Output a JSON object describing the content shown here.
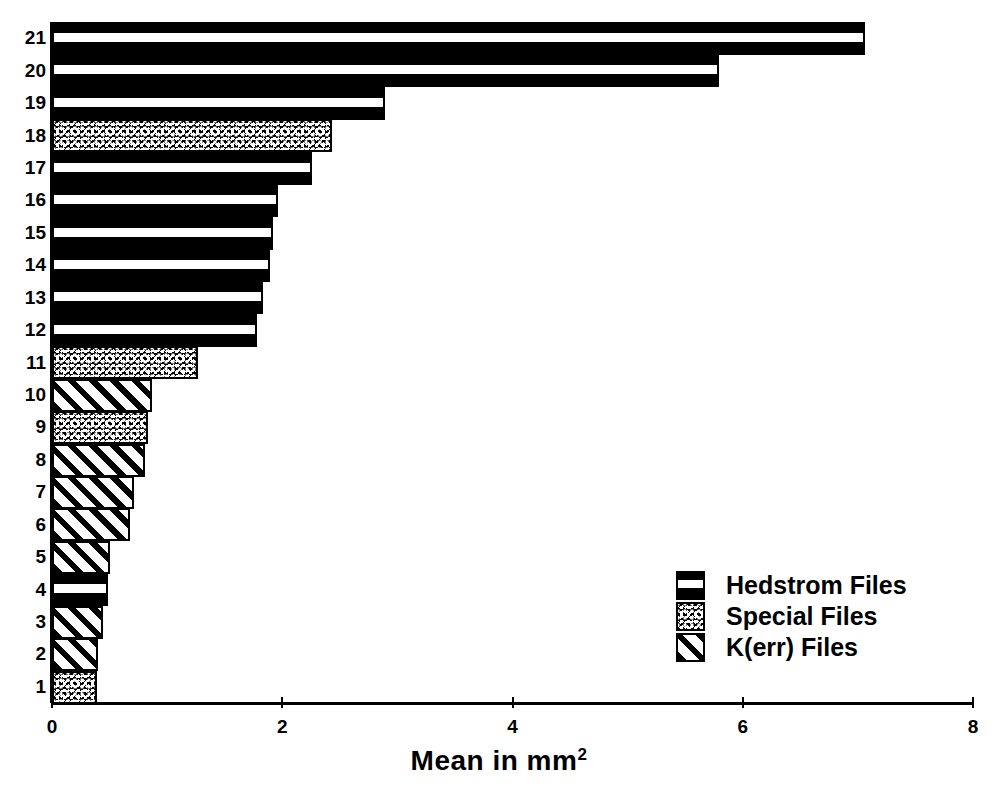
{
  "chart_data": {
    "type": "bar",
    "orientation": "horizontal",
    "title": "",
    "subtitle": "",
    "xlabel": "Mean in mm2",
    "xlabel_display": "Mean in mm",
    "xlabel_superscript": "2",
    "ylabel": "",
    "xlim": [
      0,
      8
    ],
    "xticks": [
      0,
      2,
      4,
      6,
      8
    ],
    "xtick_labels": [
      "0",
      "2",
      "4",
      "6",
      "8"
    ],
    "grid": false,
    "legend_position": "center-right",
    "categories": [
      "1",
      "2",
      "3",
      "4",
      "5",
      "6",
      "7",
      "8",
      "9",
      "10",
      "11",
      "12",
      "13",
      "14",
      "15",
      "16",
      "17",
      "18",
      "19",
      "20",
      "21"
    ],
    "bars": [
      {
        "category": "1",
        "value": 0.39,
        "series": "K(err) Files",
        "pattern": "special"
      },
      {
        "category": "2",
        "value": 0.4,
        "series": "K(err) Files",
        "pattern": "kerr"
      },
      {
        "category": "3",
        "value": 0.44,
        "series": "K(err) Files",
        "pattern": "kerr"
      },
      {
        "category": "4",
        "value": 0.49,
        "series": "Hedstrom Files",
        "pattern": "hedstrom"
      },
      {
        "category": "5",
        "value": 0.5,
        "series": "K(err) Files",
        "pattern": "kerr"
      },
      {
        "category": "6",
        "value": 0.68,
        "series": "K(err) Files",
        "pattern": "kerr"
      },
      {
        "category": "7",
        "value": 0.71,
        "series": "K(err) Files",
        "pattern": "kerr"
      },
      {
        "category": "8",
        "value": 0.81,
        "series": "K(err) Files",
        "pattern": "kerr"
      },
      {
        "category": "9",
        "value": 0.83,
        "series": "Special Files",
        "pattern": "special"
      },
      {
        "category": "10",
        "value": 0.87,
        "series": "K(err) Files",
        "pattern": "kerr"
      },
      {
        "category": "11",
        "value": 1.27,
        "series": "Special Files",
        "pattern": "special"
      },
      {
        "category": "12",
        "value": 1.78,
        "series": "Hedstrom Files",
        "pattern": "hedstrom"
      },
      {
        "category": "13",
        "value": 1.83,
        "series": "Hedstrom Files",
        "pattern": "hedstrom"
      },
      {
        "category": "14",
        "value": 1.89,
        "series": "Hedstrom Files",
        "pattern": "hedstrom"
      },
      {
        "category": "15",
        "value": 1.92,
        "series": "Hedstrom Files",
        "pattern": "hedstrom"
      },
      {
        "category": "16",
        "value": 1.96,
        "series": "Hedstrom Files",
        "pattern": "hedstrom"
      },
      {
        "category": "17",
        "value": 2.26,
        "series": "Hedstrom Files",
        "pattern": "hedstrom"
      },
      {
        "category": "18",
        "value": 2.43,
        "series": "Special Files",
        "pattern": "special"
      },
      {
        "category": "19",
        "value": 2.89,
        "series": "Hedstrom Files",
        "pattern": "hedstrom"
      },
      {
        "category": "20",
        "value": 5.79,
        "series": "Hedstrom Files",
        "pattern": "hedstrom"
      },
      {
        "category": "21",
        "value": 7.06,
        "series": "Hedstrom Files",
        "pattern": "hedstrom"
      }
    ],
    "legend": [
      {
        "label": "Hedstrom Files",
        "pattern": "hedstrom"
      },
      {
        "label": "Special Files",
        "pattern": "special"
      },
      {
        "label": "K(err) Files",
        "pattern": "kerr"
      }
    ],
    "colors": {
      "ink": "#000000",
      "paper": "#ffffff"
    }
  }
}
